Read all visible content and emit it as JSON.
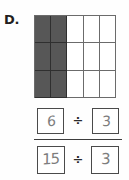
{
  "item": {
    "label": "D."
  },
  "area_model": {
    "columns": 5,
    "rows": 3,
    "total_cells": 15,
    "shaded_cells": 6,
    "shaded_columns": 2,
    "shaded_color": "#575757",
    "unshaded_color": "#ffffff",
    "grid_line_color": "#6b6b6b",
    "cells": [
      {
        "shaded": true
      },
      {
        "shaded": true
      },
      {
        "shaded": false
      },
      {
        "shaded": false
      },
      {
        "shaded": false
      },
      {
        "shaded": true
      },
      {
        "shaded": true
      },
      {
        "shaded": false
      },
      {
        "shaded": false
      },
      {
        "shaded": false
      },
      {
        "shaded": true
      },
      {
        "shaded": true
      },
      {
        "shaded": false
      },
      {
        "shaded": false
      },
      {
        "shaded": false
      }
    ]
  },
  "fraction": {
    "numerator": {
      "dividend": "6",
      "operator": "÷",
      "divisor": "3"
    },
    "denominator": {
      "dividend": "15",
      "operator": "÷",
      "divisor": "3"
    },
    "handwriting_color": "#7d7d7d",
    "box_border_color": "#4a4a4a"
  }
}
